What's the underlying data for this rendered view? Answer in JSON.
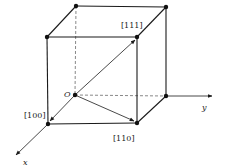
{
  "diagram": {
    "origin_label": "O",
    "axes": [
      {
        "name": "x",
        "label": "x"
      },
      {
        "name": "y",
        "label": "y"
      }
    ],
    "direction_labels": {
      "d100": "[100]",
      "d110": "[110]",
      "d111": "[111]"
    },
    "colors": {
      "line": "#1a1a1a",
      "dashed": "#555555",
      "background": "#ffffff"
    }
  }
}
